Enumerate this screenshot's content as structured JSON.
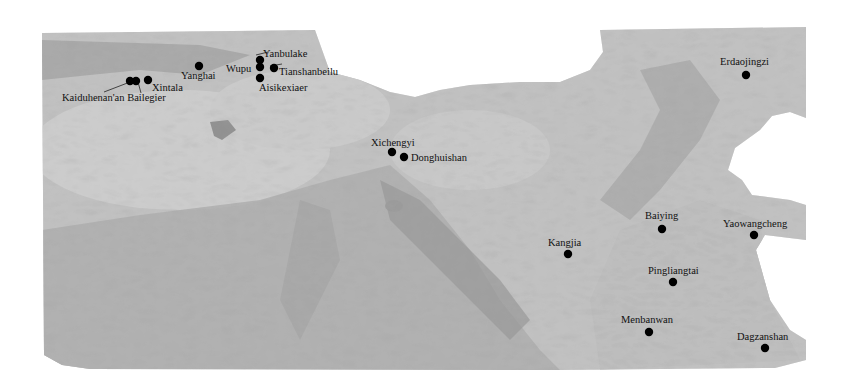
{
  "map": {
    "type": "relief map (grayscale) of northern China",
    "background": "#ffffff",
    "land_color": "#b8b8b8",
    "marker_color": "#000000",
    "label_color": "#111111"
  },
  "sites": [
    {
      "name": "Kaiduhenan'an Bailegier",
      "x": 130,
      "y": 81,
      "label_x": 62,
      "label_y": 101
    },
    {
      "name": "Kaiduhenan'an Bailegier (2)",
      "x": 136,
      "y": 81,
      "label_x": null,
      "label_y": null
    },
    {
      "name": "Xintala",
      "x": 148,
      "y": 80,
      "label_x": 152,
      "label_y": 91
    },
    {
      "name": "Yanghai",
      "x": 199,
      "y": 66,
      "label_x": 181,
      "label_y": 79
    },
    {
      "name": "Wupu",
      "x": 260,
      "y": 67,
      "label_x": 226,
      "label_y": 72
    },
    {
      "name": "Yanbulake",
      "x": 260,
      "y": 60,
      "label_x": 263,
      "label_y": 57
    },
    {
      "name": "Tianshanbeilu",
      "x": 274,
      "y": 68,
      "label_x": 279,
      "label_y": 75
    },
    {
      "name": "Aisikexiaer",
      "x": 260,
      "y": 78,
      "label_x": 259,
      "label_y": 91
    },
    {
      "name": "Xichengyi",
      "x": 392,
      "y": 152,
      "label_x": 371,
      "label_y": 146
    },
    {
      "name": "Donghuishan",
      "x": 404,
      "y": 157,
      "label_x": 411,
      "label_y": 161
    },
    {
      "name": "Erdaojingzi",
      "x": 746,
      "y": 75,
      "label_x": 720,
      "label_y": 65
    },
    {
      "name": "Baiying",
      "x": 662,
      "y": 229,
      "label_x": 645,
      "label_y": 219
    },
    {
      "name": "Yaowangcheng",
      "x": 754,
      "y": 235,
      "label_x": 723,
      "label_y": 227
    },
    {
      "name": "Kangjia",
      "x": 568,
      "y": 254,
      "label_x": 548,
      "label_y": 246
    },
    {
      "name": "Pingliangtai",
      "x": 673,
      "y": 282,
      "label_x": 648,
      "label_y": 274
    },
    {
      "name": "Menbanwan",
      "x": 649,
      "y": 332,
      "label_x": 621,
      "label_y": 323
    },
    {
      "name": "Dagzanshan",
      "x": 765,
      "y": 348,
      "label_x": 737,
      "label_y": 340
    }
  ]
}
